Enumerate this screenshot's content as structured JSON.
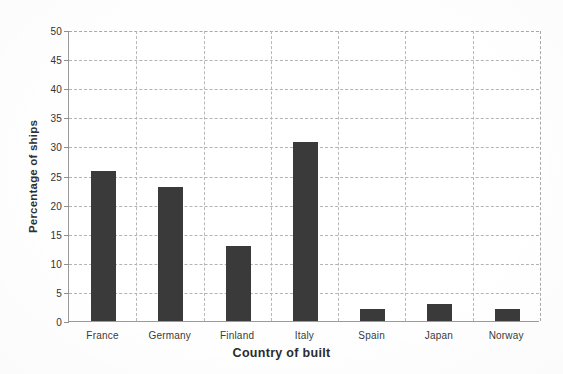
{
  "chart_data": {
    "type": "bar",
    "title": "",
    "xlabel": "Country of built",
    "ylabel": "Percentage of ships",
    "categories": [
      "France",
      "Germany",
      "Finland",
      "Italy",
      "Spain",
      "Japan",
      "Norway"
    ],
    "values": [
      25.8,
      23.0,
      12.9,
      30.8,
      2.0,
      2.9,
      2.0
    ],
    "series": [
      {
        "name": "Percentage of ships",
        "values": [
          25.8,
          23.0,
          12.9,
          30.8,
          2.0,
          2.9,
          2.0
        ]
      }
    ],
    "ylim": [
      0,
      50
    ],
    "ytick_labels": [
      "0",
      "5",
      "10",
      "15",
      "20",
      "25",
      "30",
      "35",
      "40",
      "45",
      "50"
    ],
    "ytick_values": [
      0,
      5,
      10,
      15,
      20,
      25,
      30,
      35,
      40,
      45,
      50
    ],
    "ytick_step": 5,
    "grid": "both-dashed",
    "legend": "none",
    "bar_color": "#3a3a3a",
    "grid_color": "#b4b4b4",
    "axis_color": "#9a9a9a",
    "background_color": "#ffffff"
  },
  "axes": {
    "y_title": "Percentage of ships",
    "x_title": "Country of built"
  }
}
